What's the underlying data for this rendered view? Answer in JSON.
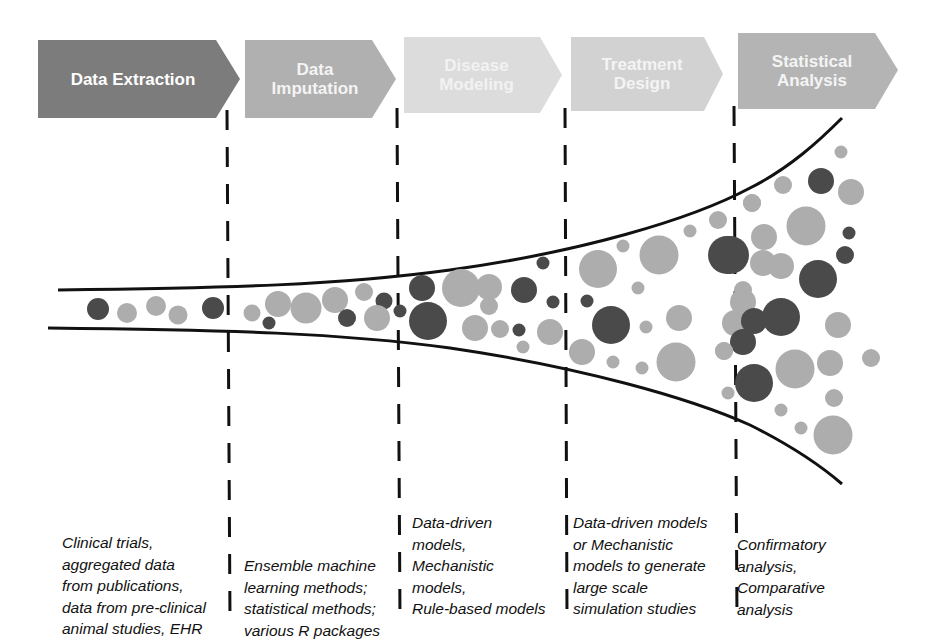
{
  "stages": [
    {
      "title": "Data Extraction",
      "color": "#7c7c7c",
      "text_color": "#ffffff",
      "description": "Clinical trials,\naggregated data\nfrom publications,\ndata from pre-clinical\nanimal studies, EHR"
    },
    {
      "title": "Data\nImputation",
      "color": "#b0b0b0",
      "text_color": "#f4f4f4",
      "description": "Ensemble machine\nlearning methods;\nstatistical methods;\nvarious R packages"
    },
    {
      "title": "Disease\nModeling",
      "color": "#dcdcdc",
      "text_color": "#f2f2f2",
      "description": "Data-driven\nmodels,\nMechanistic\nmodels,\nRule-based models"
    },
    {
      "title": "Treatment\nDesign",
      "color": "#d2d2d2",
      "text_color": "#f4f4f4",
      "description": "Data-driven models\nor Mechanistic\nmodels to generate\nlarge scale\nsimulation studies"
    },
    {
      "title": "Statistical\nAnalysis",
      "color": "#b4b4b4",
      "text_color": "#f4f4f4",
      "description": "Confirmatory\nanalysis,\nComparative\nanalysis"
    }
  ],
  "colors": {
    "dark": "#4a4a4a",
    "mid": "#8f8f8f",
    "light": "#adadad",
    "line": "#111111"
  },
  "circles": [
    {
      "x": 98,
      "y": 309,
      "r": 11,
      "shade": "dark"
    },
    {
      "x": 127,
      "y": 313,
      "r": 10,
      "shade": "light"
    },
    {
      "x": 156,
      "y": 306,
      "r": 10,
      "shade": "light"
    },
    {
      "x": 178,
      "y": 315,
      "r": 9.5,
      "shade": "light"
    },
    {
      "x": 213,
      "y": 308,
      "r": 11,
      "shade": "dark"
    },
    {
      "x": 252,
      "y": 313,
      "r": 8.5,
      "shade": "light"
    },
    {
      "x": 269,
      "y": 323,
      "r": 6.5,
      "shade": "dark"
    },
    {
      "x": 278,
      "y": 304,
      "r": 13,
      "shade": "light"
    },
    {
      "x": 306,
      "y": 308,
      "r": 15.5,
      "shade": "light"
    },
    {
      "x": 335,
      "y": 300,
      "r": 13,
      "shade": "light"
    },
    {
      "x": 347,
      "y": 318,
      "r": 9,
      "shade": "dark"
    },
    {
      "x": 364,
      "y": 292,
      "r": 9,
      "shade": "light"
    },
    {
      "x": 384,
      "y": 301,
      "r": 8.5,
      "shade": "dark"
    },
    {
      "x": 377,
      "y": 318,
      "r": 13,
      "shade": "light"
    },
    {
      "x": 400,
      "y": 311,
      "r": 6.5,
      "shade": "dark"
    },
    {
      "x": 422,
      "y": 288,
      "r": 13,
      "shade": "dark"
    },
    {
      "x": 428,
      "y": 321,
      "r": 19,
      "shade": "dark"
    },
    {
      "x": 461,
      "y": 288,
      "r": 19,
      "shade": "light"
    },
    {
      "x": 489,
      "y": 287,
      "r": 13,
      "shade": "light"
    },
    {
      "x": 489,
      "y": 306,
      "r": 9,
      "shade": "light"
    },
    {
      "x": 524,
      "y": 290,
      "r": 13,
      "shade": "dark"
    },
    {
      "x": 543,
      "y": 263,
      "r": 6.5,
      "shade": "dark"
    },
    {
      "x": 553,
      "y": 302,
      "r": 6.5,
      "shade": "dark"
    },
    {
      "x": 475,
      "y": 328,
      "r": 13,
      "shade": "light"
    },
    {
      "x": 500,
      "y": 329,
      "r": 9,
      "shade": "light"
    },
    {
      "x": 519,
      "y": 330,
      "r": 6.5,
      "shade": "dark"
    },
    {
      "x": 523,
      "y": 347,
      "r": 6.5,
      "shade": "light"
    },
    {
      "x": 550,
      "y": 332,
      "r": 13,
      "shade": "light"
    },
    {
      "x": 598,
      "y": 269,
      "r": 19,
      "shade": "light"
    },
    {
      "x": 587,
      "y": 301,
      "r": 6.5,
      "shade": "dark"
    },
    {
      "x": 623,
      "y": 246,
      "r": 6.5,
      "shade": "light"
    },
    {
      "x": 659,
      "y": 255,
      "r": 19.5,
      "shade": "light"
    },
    {
      "x": 638,
      "y": 288,
      "r": 6.5,
      "shade": "light"
    },
    {
      "x": 611,
      "y": 325,
      "r": 19,
      "shade": "dark"
    },
    {
      "x": 646,
      "y": 327,
      "r": 6.5,
      "shade": "light"
    },
    {
      "x": 679,
      "y": 318,
      "r": 13,
      "shade": "light"
    },
    {
      "x": 582,
      "y": 352,
      "r": 13,
      "shade": "light"
    },
    {
      "x": 613,
      "y": 362,
      "r": 6.5,
      "shade": "light"
    },
    {
      "x": 642,
      "y": 368,
      "r": 6.5,
      "shade": "light"
    },
    {
      "x": 676,
      "y": 362,
      "r": 19.5,
      "shade": "light"
    },
    {
      "x": 690,
      "y": 231,
      "r": 6.5,
      "shade": "light"
    },
    {
      "x": 718,
      "y": 220,
      "r": 9,
      "shade": "light"
    },
    {
      "x": 730,
      "y": 255,
      "r": 19,
      "shade": "dark"
    },
    {
      "x": 743,
      "y": 290,
      "r": 9,
      "shade": "light"
    },
    {
      "x": 735,
      "y": 323,
      "r": 13,
      "shade": "light"
    },
    {
      "x": 743,
      "y": 342,
      "r": 13,
      "shade": "dark"
    },
    {
      "x": 724,
      "y": 351,
      "r": 9,
      "shade": "light"
    },
    {
      "x": 728,
      "y": 393,
      "r": 6.5,
      "shade": "light"
    },
    {
      "x": 841,
      "y": 152,
      "r": 6.5,
      "shade": "light"
    },
    {
      "x": 821,
      "y": 181,
      "r": 13,
      "shade": "dark"
    },
    {
      "x": 851,
      "y": 192,
      "r": 13,
      "shade": "light"
    },
    {
      "x": 783,
      "y": 185,
      "r": 9,
      "shade": "light"
    },
    {
      "x": 752,
      "y": 203,
      "r": 9,
      "shade": "light"
    },
    {
      "x": 752,
      "y": 203,
      "r": 9,
      "shade": "light"
    },
    {
      "x": 764,
      "y": 237,
      "r": 13,
      "shade": "light"
    },
    {
      "x": 806,
      "y": 226,
      "r": 19.5,
      "shade": "light"
    },
    {
      "x": 849,
      "y": 233,
      "r": 6.5,
      "shade": "dark"
    },
    {
      "x": 727,
      "y": 255,
      "r": 19,
      "shade": "dark"
    },
    {
      "x": 763,
      "y": 263,
      "r": 13,
      "shade": "light"
    },
    {
      "x": 845,
      "y": 255,
      "r": 9,
      "shade": "dark"
    },
    {
      "x": 818,
      "y": 279,
      "r": 19,
      "shade": "dark"
    },
    {
      "x": 781,
      "y": 266,
      "r": 13,
      "shade": "light"
    },
    {
      "x": 743,
      "y": 302,
      "r": 13,
      "shade": "light"
    },
    {
      "x": 754,
      "y": 321,
      "r": 13,
      "shade": "dark"
    },
    {
      "x": 781,
      "y": 317,
      "r": 19,
      "shade": "dark"
    },
    {
      "x": 838,
      "y": 325,
      "r": 13,
      "shade": "light"
    },
    {
      "x": 724,
      "y": 351,
      "r": 9,
      "shade": "light"
    },
    {
      "x": 795,
      "y": 369,
      "r": 19.5,
      "shade": "light"
    },
    {
      "x": 830,
      "y": 363,
      "r": 13,
      "shade": "light"
    },
    {
      "x": 871,
      "y": 358,
      "r": 9,
      "shade": "light"
    },
    {
      "x": 754,
      "y": 383,
      "r": 19,
      "shade": "dark"
    },
    {
      "x": 834,
      "y": 398,
      "r": 9,
      "shade": "light"
    },
    {
      "x": 781,
      "y": 410,
      "r": 6.5,
      "shade": "light"
    },
    {
      "x": 801,
      "y": 428,
      "r": 6.5,
      "shade": "light"
    },
    {
      "x": 833,
      "y": 435,
      "r": 19.5,
      "shade": "light"
    }
  ]
}
